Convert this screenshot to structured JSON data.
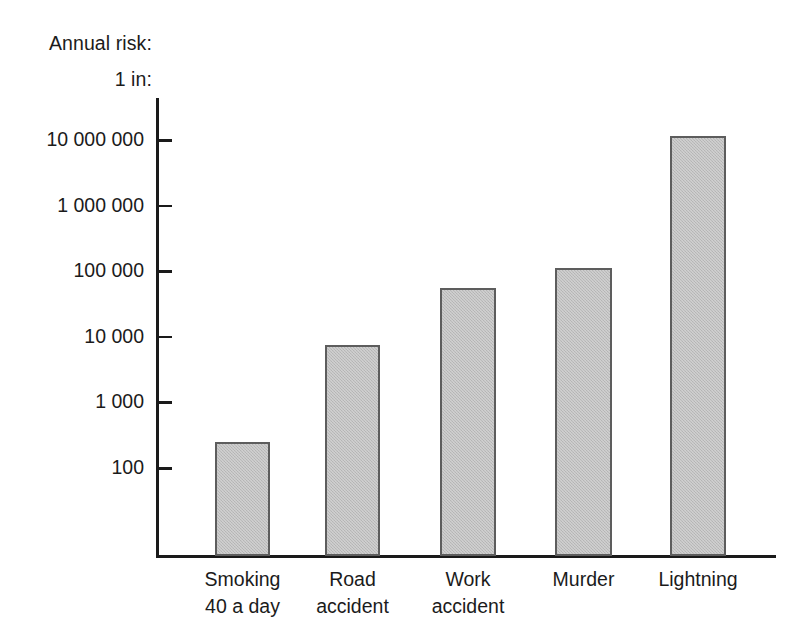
{
  "chart_data": {
    "type": "bar",
    "title": "",
    "subtitle": "",
    "axis_title_lines": [
      "Annual risk:",
      "1 in:"
    ],
    "xlabel": "",
    "ylabel": "Annual risk: 1 in:",
    "yscale": "log",
    "ylim": [
      100,
      10000000
    ],
    "grid": false,
    "legend": null,
    "categories": [
      "Smoking 40 a day",
      "Road accident",
      "Work accident",
      "Murder",
      "Lightning"
    ],
    "category_lines": [
      [
        "Smoking",
        "40 a day"
      ],
      [
        "Road",
        "accident"
      ],
      [
        "Work",
        "accident"
      ],
      [
        "Murder",
        ""
      ],
      [
        "Lightning",
        ""
      ]
    ],
    "values": [
      250,
      7500,
      55000,
      110000,
      11500000
    ],
    "ytick_values": [
      100,
      1000,
      10000,
      100000,
      1000000,
      10000000
    ],
    "ytick_labels": [
      "100",
      "1 000",
      "10 000",
      "100 000",
      "1 000 000",
      "10 000 000"
    ],
    "colors": {
      "bar_fill": "#bcbcbc",
      "bar_border": "#5d5d5d",
      "axis": "#1a1a1a",
      "text": "#1b1b1b",
      "background": "#ffffff"
    }
  }
}
